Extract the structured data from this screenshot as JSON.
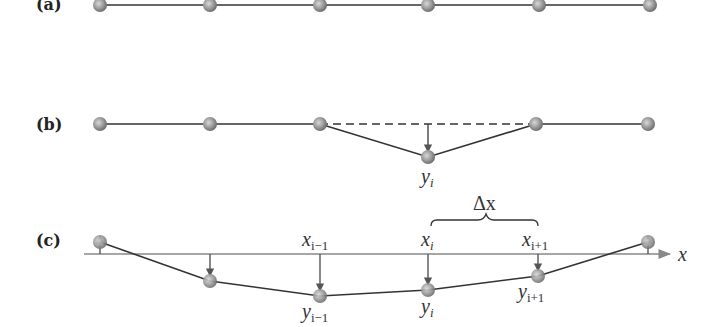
{
  "panels": {
    "a": {
      "label": "(a)"
    },
    "b": {
      "label": "(b)",
      "y_label": {
        "base": "y",
        "sub": "i"
      }
    },
    "c": {
      "label": "(c)",
      "axis_label": "x",
      "delta_label": "Δx",
      "x_labels": [
        {
          "base": "x",
          "sub": "i−1"
        },
        {
          "base": "x",
          "sub": "i"
        },
        {
          "base": "x",
          "sub": "i+1"
        }
      ],
      "y_labels": [
        {
          "base": "y",
          "sub": "i−1"
        },
        {
          "base": "y",
          "sub": "i"
        },
        {
          "base": "y",
          "sub": "i+1"
        }
      ]
    }
  },
  "colors": {
    "line": "#333333",
    "axis": "#888888",
    "node": "#8a8a8a"
  }
}
